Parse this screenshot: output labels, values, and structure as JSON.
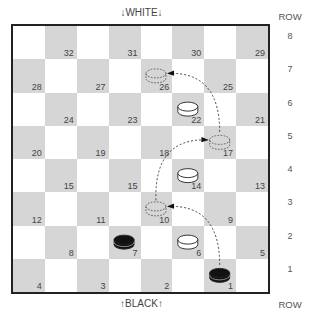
{
  "labels": {
    "top": "↓WHITE↓",
    "bottom": "↑BLACK↑",
    "row_header_top": "ROW",
    "row_header_bottom": "ROW"
  },
  "rows": [
    "8",
    "7",
    "6",
    "5",
    "4",
    "3",
    "2",
    "1"
  ],
  "squares": [
    {
      "r": 0,
      "c": 1,
      "n": "32"
    },
    {
      "r": 0,
      "c": 3,
      "n": "31"
    },
    {
      "r": 0,
      "c": 5,
      "n": "30"
    },
    {
      "r": 0,
      "c": 7,
      "n": "29"
    },
    {
      "r": 1,
      "c": 0,
      "n": "28"
    },
    {
      "r": 1,
      "c": 2,
      "n": "27"
    },
    {
      "r": 1,
      "c": 4,
      "n": "26"
    },
    {
      "r": 1,
      "c": 6,
      "n": "25"
    },
    {
      "r": 2,
      "c": 1,
      "n": "24"
    },
    {
      "r": 2,
      "c": 3,
      "n": "23"
    },
    {
      "r": 2,
      "c": 5,
      "n": "22"
    },
    {
      "r": 2,
      "c": 7,
      "n": "21"
    },
    {
      "r": 3,
      "c": 0,
      "n": "20"
    },
    {
      "r": 3,
      "c": 2,
      "n": "19"
    },
    {
      "r": 3,
      "c": 4,
      "n": "18"
    },
    {
      "r": 3,
      "c": 6,
      "n": "17"
    },
    {
      "r": 4,
      "c": 1,
      "n": "15"
    },
    {
      "r": 4,
      "c": 3,
      "n": "15"
    },
    {
      "r": 4,
      "c": 5,
      "n": "14"
    },
    {
      "r": 4,
      "c": 7,
      "n": "13"
    },
    {
      "r": 5,
      "c": 0,
      "n": "12"
    },
    {
      "r": 5,
      "c": 2,
      "n": "11"
    },
    {
      "r": 5,
      "c": 4,
      "n": "10"
    },
    {
      "r": 5,
      "c": 6,
      "n": "9"
    },
    {
      "r": 6,
      "c": 1,
      "n": "8"
    },
    {
      "r": 6,
      "c": 3,
      "n": "7"
    },
    {
      "r": 6,
      "c": 5,
      "n": "6"
    },
    {
      "r": 6,
      "c": 7,
      "n": "5"
    },
    {
      "r": 7,
      "c": 0,
      "n": "4"
    },
    {
      "r": 7,
      "c": 2,
      "n": "3"
    },
    {
      "r": 7,
      "c": 4,
      "n": "2"
    },
    {
      "r": 7,
      "c": 6,
      "n": "1"
    }
  ],
  "pieces": [
    {
      "square": "22",
      "color": "white",
      "type": "piece"
    },
    {
      "square": "14",
      "color": "white",
      "type": "piece"
    },
    {
      "square": "6",
      "color": "white",
      "type": "piece"
    },
    {
      "square": "7",
      "color": "black",
      "type": "piece"
    },
    {
      "square": "1",
      "color": "black",
      "type": "piece"
    },
    {
      "square": "10",
      "color": "none",
      "type": "ghost"
    },
    {
      "square": "17",
      "color": "none",
      "type": "ghost"
    },
    {
      "square": "26",
      "color": "none",
      "type": "ghost"
    }
  ],
  "moves": [
    {
      "from": "1",
      "to": "10",
      "jumped": "6"
    },
    {
      "from": "10",
      "to": "17",
      "jumped": "14"
    },
    {
      "from": "17",
      "to": "26",
      "jumped": "22"
    }
  ],
  "colors": {
    "dark_square": "#d6d6d6",
    "light_square": "#ffffff",
    "border": "#222222",
    "black_piece": "#111111",
    "white_piece": "#ffffff"
  }
}
